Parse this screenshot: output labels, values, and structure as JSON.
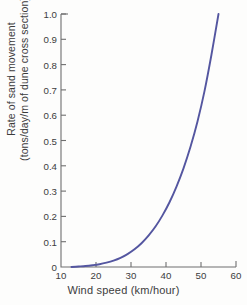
{
  "chart_data": {
    "type": "line",
    "title": "",
    "xlabel": "Wind speed (km/hour)",
    "ylabel": "Rate of sand movement\n(tons/day/m of dune cross section)",
    "ylabel_lines": [
      "Rate of sand movement",
      "(tons/day/m of dune cross section)"
    ],
    "xlim": [
      10,
      60
    ],
    "ylim": [
      0,
      1.0
    ],
    "grid": false,
    "legend": false,
    "legend_position": "none",
    "xticks": [
      10,
      20,
      30,
      40,
      50,
      60
    ],
    "xtick_labels": [
      "10",
      "20",
      "30",
      "40",
      "50",
      "60"
    ],
    "yticks": [
      0,
      0.1,
      0.2,
      0.3,
      0.4,
      0.5,
      0.6,
      0.7,
      0.8,
      0.9,
      1.0
    ],
    "ytick_labels": [
      "0",
      "0.1",
      "0.2",
      "0.3",
      "0.4",
      "0.5",
      "0.6",
      "0.7",
      "0.8",
      "0.9",
      "1.0"
    ],
    "series": [
      {
        "name": "Rate of sand movement",
        "color": "#5456a0",
        "x": [
          13,
          15,
          17,
          19,
          21,
          23,
          25,
          27,
          29,
          31,
          33,
          35,
          37,
          39,
          41,
          43,
          45,
          47,
          49,
          51,
          53,
          55
        ],
        "y": [
          0.0,
          0.002,
          0.004,
          0.007,
          0.011,
          0.017,
          0.025,
          0.036,
          0.051,
          0.07,
          0.094,
          0.124,
          0.16,
          0.204,
          0.256,
          0.318,
          0.39,
          0.475,
          0.575,
          0.695,
          0.84,
          1.0
        ]
      }
    ]
  },
  "style": {
    "curve_color": "#5456a0",
    "axis_color": "#6f6f6f",
    "text_color": "#3c3c3c",
    "background": "#fdfdfc"
  },
  "geometry": {
    "plot_left": 61,
    "plot_right": 236,
    "plot_top": 14,
    "plot_bottom": 267
  }
}
